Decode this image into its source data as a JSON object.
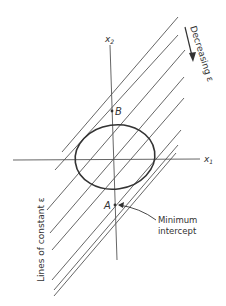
{
  "diagram": {
    "axes": {
      "x1_label": "x",
      "x1_sub": "1",
      "x2_label": "x",
      "x2_sub": "2"
    },
    "points": [
      {
        "id": "B",
        "label": "B"
      },
      {
        "id": "A",
        "label": "A"
      }
    ],
    "annotations": {
      "decreasing": "Decreasing ε",
      "lines_constant": "Lines of constant ε",
      "minimum_line1": "Minimum",
      "minimum_line2": "intercept"
    },
    "colors": {
      "ink": "#333333",
      "line": "#555555",
      "background": "#ffffff"
    }
  }
}
